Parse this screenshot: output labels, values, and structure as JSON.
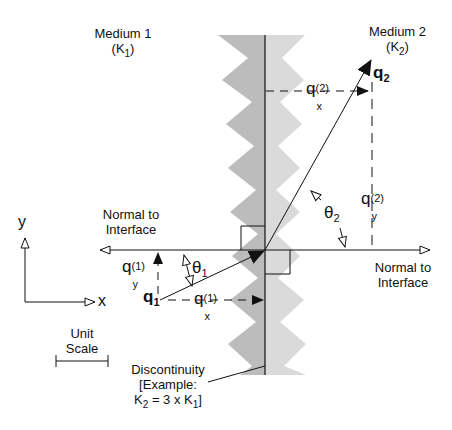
{
  "diagram": {
    "medium1": {
      "name": "Medium 1",
      "conductivity": "(K",
      "conductivity_sub": "1",
      "conductivity_close": ")"
    },
    "medium2": {
      "name": "Medium 2",
      "conductivity": "(K",
      "conductivity_sub": "2",
      "conductivity_close": ")"
    },
    "normal_left": {
      "line1": "Normal to",
      "line2": "Interface"
    },
    "normal_right": {
      "line1": "Normal to",
      "line2": "Interface"
    },
    "axes": {
      "x": "x",
      "y": "y"
    },
    "unit_scale": {
      "line1": "Unit",
      "line2": "Scale"
    },
    "discontinuity": {
      "line1": "Discontinuity",
      "line2": "[Example:",
      "line3_a": "K",
      "line3_a_sub": "2",
      "line3_b": " = 3 x K",
      "line3_b_sub": "1",
      "line3_c": "]"
    },
    "vectors": {
      "q1": {
        "base": "q",
        "sub": "1"
      },
      "q2": {
        "base": "q",
        "sub": "2"
      },
      "qx1": {
        "base": "q",
        "sup": "(1)",
        "sub": "x"
      },
      "qy1": {
        "base": "q",
        "sup": "(1)",
        "sub": "y"
      },
      "qx2": {
        "base": "q",
        "sup": "(2)",
        "sub": "x"
      },
      "qy2": {
        "base": "q",
        "sup": "(2)",
        "sub": "y"
      }
    },
    "angles": {
      "theta1": {
        "base": "θ",
        "sub": "1"
      },
      "theta2": {
        "base": "θ",
        "sub": "2"
      }
    },
    "colors": {
      "medium1_band": "#bcbcbc",
      "medium2_band": "#dadada",
      "line": "#111111"
    }
  }
}
